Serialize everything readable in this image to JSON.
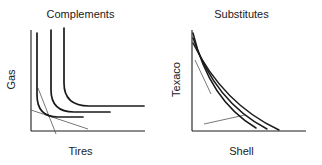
{
  "figure": {
    "background": "#ffffff",
    "ink": "#1a1a1a",
    "thin_line_color": "#555555"
  },
  "panels": [
    {
      "key": "complements",
      "title": "Complements",
      "xlabel": "Tires",
      "ylabel": "Gas"
    },
    {
      "key": "substitutes",
      "title": "Substitutes",
      "xlabel": "Shell",
      "ylabel": "Texaco"
    }
  ],
  "chart_data": [
    {
      "type": "line",
      "title": "Complements",
      "xlabel": "Tires",
      "ylabel": "Gas",
      "curve_shape": "L-shaped perfect complements (Leontief) indifference curves",
      "grid": false,
      "legend": null,
      "axis_origin": [
        31,
        131
      ],
      "x_axis_end": [
        145,
        131
      ],
      "y_axis_end": [
        31,
        30
      ],
      "xlim": [
        0,
        1
      ],
      "ylim": [
        0,
        1
      ],
      "series": [
        {
          "name": "indifference-curve-1",
          "kink": [
            0.105,
            0.21
          ],
          "path": "M 37 33 L 37 95 Q 37 117 58 117 L 83 117"
        },
        {
          "name": "indifference-curve-2",
          "kink": [
            0.18,
            0.28
          ],
          "path": "M 51 30 L 51 90 Q 51 112 74 112 L 110 112"
        },
        {
          "name": "indifference-curve-3",
          "kink": [
            0.27,
            0.36
          ],
          "path": "M 64 28 L 64 83 Q 64 106 89 106 L 144 106"
        }
      ],
      "annotations": [
        {
          "name": "budget-line-steep",
          "type": "thin-straight-line",
          "from": [
            38,
            88
          ],
          "to": [
            56,
            134
          ]
        },
        {
          "name": "budget-line-shallow",
          "type": "thin-straight-line",
          "from": [
            31,
            110
          ],
          "to": [
            88,
            129
          ]
        }
      ]
    },
    {
      "type": "line",
      "title": "Substitutes",
      "xlabel": "Shell",
      "ylabel": "Texaco",
      "curve_shape": "Convex downward-sloping near-linear substitute indifference curves",
      "grid": false,
      "legend": null,
      "axis_origin": [
        31,
        131
      ],
      "x_axis_end": [
        145,
        131
      ],
      "y_axis_end": [
        31,
        30
      ],
      "xlim": [
        0,
        1
      ],
      "ylim": [
        0,
        1
      ],
      "series": [
        {
          "name": "indifference-curve-1",
          "path": "M 32 33 Q 48 100 95 128"
        },
        {
          "name": "indifference-curve-2",
          "path": "M 32 38 Q 54 102 106 129"
        },
        {
          "name": "indifference-curve-3",
          "path": "M 32 43 Q 62 104 118 130"
        }
      ],
      "annotations": [
        {
          "name": "tangent-line-upper",
          "type": "thin-straight-line",
          "from": [
            34,
            60
          ],
          "to": [
            50,
            94
          ]
        },
        {
          "name": "tangent-line-lower",
          "type": "thin-straight-line",
          "from": [
            43,
            124
          ],
          "to": [
            84,
            115
          ]
        }
      ]
    }
  ]
}
